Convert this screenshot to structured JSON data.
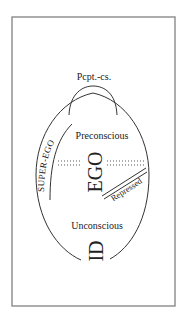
{
  "diagram": {
    "labels": {
      "perception_consciousness": "Pcpt.-cs.",
      "super_ego": "SUPER-EGO",
      "preconscious": "Preconscious",
      "ego": "EGO",
      "repressed": "Repressed",
      "unconscious": "Unconscious",
      "id": "ID"
    },
    "colors": {
      "frame": "#8a8a8a",
      "stroke": "#333333",
      "text": "#222222",
      "background": "#ffffff"
    }
  }
}
